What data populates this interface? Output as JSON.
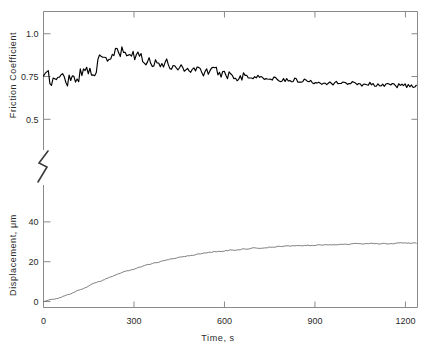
{
  "figure": {
    "background": "#ffffff",
    "frame_color": "#8a8a8a",
    "axis_break_present": true
  },
  "xaxis": {
    "label": "Time, s",
    "ticks": [
      "0",
      "300",
      "600",
      "900",
      "1200"
    ],
    "values": [
      0,
      300,
      600,
      900,
      1200
    ],
    "min": 0,
    "max": 1240
  },
  "panel_top": {
    "ylabel": "Friction Coefficient",
    "ticks": [
      "1.0",
      "0.75",
      "0.5"
    ],
    "values": [
      1.0,
      0.75,
      0.5
    ],
    "min": 0.42,
    "max": 1.13,
    "trace_color": "#000000"
  },
  "panel_bottom": {
    "ylabel": "Displacement, μm",
    "ticks": [
      "40",
      "20",
      "0"
    ],
    "values": [
      40,
      20,
      0
    ],
    "min": -3,
    "max": 52,
    "trace_color": "#6f6f6f"
  },
  "chart_data": {
    "type": "line",
    "title": "",
    "xlabel": "Time, s",
    "ylabel": "Friction Coefficient / Displacement, μm",
    "xlim": [
      0,
      1240
    ],
    "grid": false,
    "legend": "none",
    "panels": [
      {
        "name": "friction",
        "ylabel": "Friction Coefficient",
        "ylim": [
          0.42,
          1.13
        ],
        "yticks": [
          0.5,
          0.75,
          1.0
        ],
        "noisy": true,
        "noise_amplitude": 0.035,
        "x": [
          0,
          15,
          30,
          45,
          60,
          75,
          90,
          105,
          120,
          135,
          150,
          165,
          180,
          195,
          210,
          225,
          240,
          255,
          270,
          285,
          300,
          330,
          360,
          390,
          420,
          450,
          480,
          510,
          540,
          570,
          600,
          650,
          700,
          750,
          800,
          850,
          900,
          950,
          1000,
          1050,
          1100,
          1150,
          1200,
          1240
        ],
        "y": [
          0.735,
          0.74,
          0.73,
          0.745,
          0.735,
          0.75,
          0.74,
          0.755,
          0.765,
          0.775,
          0.79,
          0.8,
          0.82,
          0.835,
          0.85,
          0.865,
          0.88,
          0.89,
          0.885,
          0.878,
          0.87,
          0.855,
          0.84,
          0.828,
          0.818,
          0.808,
          0.798,
          0.79,
          0.782,
          0.775,
          0.768,
          0.757,
          0.748,
          0.74,
          0.733,
          0.727,
          0.722,
          0.717,
          0.712,
          0.708,
          0.705,
          0.7,
          0.697,
          0.695
        ]
      },
      {
        "name": "displacement",
        "ylabel": "Displacement, μm",
        "ylim": [
          -3,
          52
        ],
        "yticks": [
          0,
          20,
          40
        ],
        "noisy": false,
        "x": [
          0,
          20,
          40,
          60,
          80,
          100,
          120,
          150,
          180,
          210,
          240,
          270,
          300,
          340,
          380,
          420,
          460,
          500,
          550,
          600,
          650,
          700,
          750,
          800,
          850,
          900,
          950,
          1000,
          1050,
          1100,
          1150,
          1200,
          1240
        ],
        "y": [
          0.0,
          0.6,
          1.4,
          2.3,
          3.4,
          4.6,
          5.9,
          7.9,
          9.8,
          11.6,
          13.3,
          14.9,
          16.4,
          18.2,
          19.8,
          21.2,
          22.4,
          23.5,
          24.6,
          25.5,
          26.2,
          26.8,
          27.3,
          27.7,
          28.1,
          28.4,
          28.6,
          28.8,
          29.0,
          29.1,
          29.2,
          29.3,
          29.4
        ]
      }
    ]
  }
}
